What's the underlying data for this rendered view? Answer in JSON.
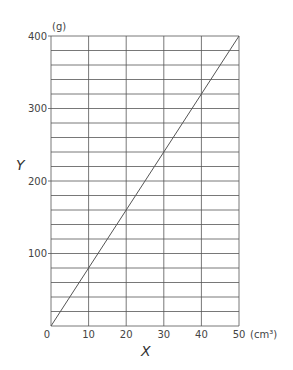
{
  "chart_data": {
    "type": "line",
    "title": "",
    "xlabel": "X",
    "ylabel": "Y",
    "x_unit": "(cm³)",
    "y_unit": "(g)",
    "xlim": [
      0,
      50
    ],
    "ylim": [
      0,
      400
    ],
    "x_ticks": [
      0,
      10,
      20,
      30,
      40,
      50
    ],
    "y_ticks": [
      100,
      200,
      300,
      400
    ],
    "x_grid_step": 10,
    "y_grid_step": 20,
    "grid": true,
    "legend": null,
    "series": [
      {
        "name": "Y vs X",
        "x": [
          0,
          10,
          20,
          30,
          40,
          50
        ],
        "values": [
          0,
          80,
          160,
          240,
          320,
          400
        ]
      }
    ]
  },
  "labels": {
    "x_axis_title": "X",
    "y_axis_title": "Y",
    "x_unit": "(cm³)",
    "y_unit": "(g)",
    "origin": "0"
  },
  "style": {
    "grid_color": "#555555",
    "line_color": "#555555",
    "background": "#ffffff"
  }
}
